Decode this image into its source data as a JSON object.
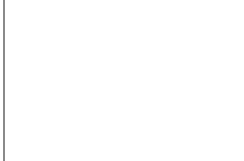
{
  "diagram": {
    "type": "bottleneck-funnel",
    "colors": {
      "background": "#ffffff",
      "curve": "#3d3d3d",
      "dot": "#5a5a5a",
      "frame": "#8a8a8a"
    },
    "curves": {
      "top": "M44,24 C80,24 90,75 125,75 C160,75 170,24 224,24",
      "bottom": "M44,141 C80,141 90,90 125,90 C160,90 170,141 224,141"
    },
    "dot_radius": 4.3,
    "dots": [
      [
        25,
        82
      ],
      [
        39,
        42
      ],
      [
        62,
        41
      ],
      [
        47,
        59
      ],
      [
        64,
        54
      ],
      [
        79,
        54
      ],
      [
        39,
        74
      ],
      [
        70,
        68
      ],
      [
        84,
        62
      ],
      [
        51,
        82
      ],
      [
        66,
        83
      ],
      [
        80,
        77
      ],
      [
        90,
        80
      ],
      [
        94,
        69
      ],
      [
        102,
        78
      ],
      [
        78,
        88
      ],
      [
        90,
        89
      ],
      [
        101,
        90
      ],
      [
        112,
        82
      ],
      [
        124,
        82
      ],
      [
        140,
        82
      ],
      [
        158,
        82
      ],
      [
        175,
        82
      ],
      [
        194,
        82
      ],
      [
        213,
        82
      ],
      [
        47,
        96
      ],
      [
        68,
        98
      ],
      [
        90,
        95
      ],
      [
        39,
        107
      ],
      [
        56,
        110
      ],
      [
        80,
        103
      ],
      [
        91,
        101
      ],
      [
        77,
        115
      ],
      [
        44,
        126
      ],
      [
        66,
        123
      ]
    ]
  }
}
